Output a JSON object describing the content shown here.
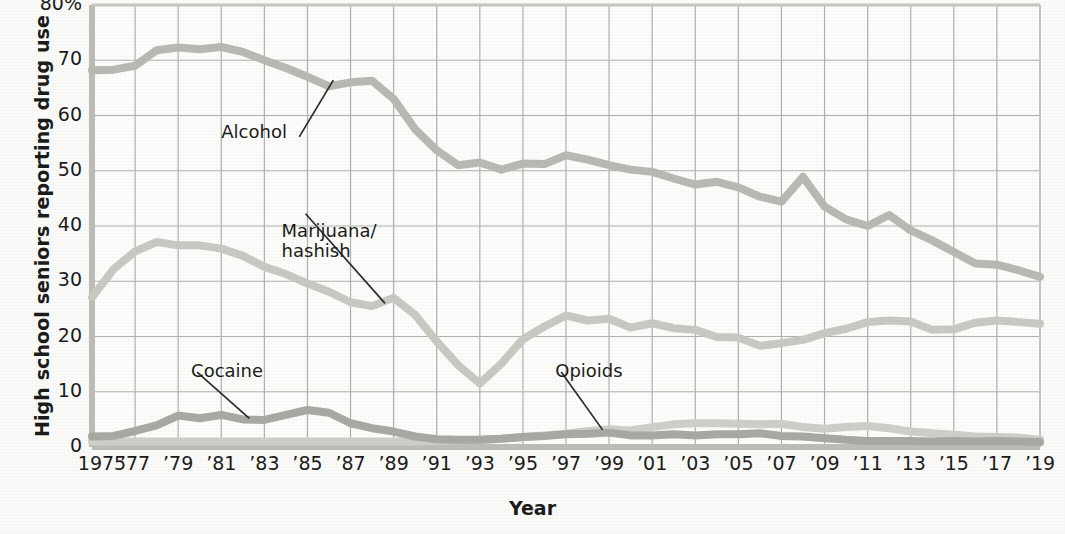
{
  "chart_data": {
    "type": "line",
    "title": "",
    "xlabel": "Year",
    "ylabel": "High school seniors reporting drug use",
    "xlim": [
      1975,
      2019
    ],
    "ylim": [
      0,
      80
    ],
    "grid": true,
    "legend_position": "inline-annotations",
    "y_ticks": [
      {
        "value": 0,
        "label": "0"
      },
      {
        "value": 10,
        "label": "10"
      },
      {
        "value": 20,
        "label": "20"
      },
      {
        "value": 30,
        "label": "30"
      },
      {
        "value": 40,
        "label": "40"
      },
      {
        "value": 50,
        "label": "50"
      },
      {
        "value": 60,
        "label": "60"
      },
      {
        "value": 70,
        "label": "70"
      },
      {
        "value": 80,
        "label": "80%"
      }
    ],
    "x_ticks": [
      {
        "value": 1975,
        "label": "1975"
      },
      {
        "value": 1977,
        "label": "’77"
      },
      {
        "value": 1979,
        "label": "’79"
      },
      {
        "value": 1981,
        "label": "’81"
      },
      {
        "value": 1983,
        "label": "’83"
      },
      {
        "value": 1985,
        "label": "’85"
      },
      {
        "value": 1987,
        "label": "’87"
      },
      {
        "value": 1989,
        "label": "’89"
      },
      {
        "value": 1991,
        "label": "’91"
      },
      {
        "value": 1993,
        "label": "’93"
      },
      {
        "value": 1995,
        "label": "’95"
      },
      {
        "value": 1997,
        "label": "’97"
      },
      {
        "value": 1999,
        "label": "’99"
      },
      {
        "value": 2001,
        "label": "’01"
      },
      {
        "value": 2003,
        "label": "’03"
      },
      {
        "value": 2005,
        "label": "’05"
      },
      {
        "value": 2007,
        "label": "’07"
      },
      {
        "value": 2009,
        "label": "’09"
      },
      {
        "value": 2011,
        "label": "’11"
      },
      {
        "value": 2013,
        "label": "’13"
      },
      {
        "value": 2015,
        "label": "’15"
      },
      {
        "value": 2017,
        "label": "’17"
      },
      {
        "value": 2019,
        "label": "’19"
      }
    ],
    "x": [
      1975,
      1976,
      1977,
      1978,
      1979,
      1980,
      1981,
      1982,
      1983,
      1984,
      1985,
      1986,
      1987,
      1988,
      1989,
      1990,
      1991,
      1992,
      1993,
      1994,
      1995,
      1996,
      1997,
      1998,
      1999,
      2000,
      2001,
      2002,
      2003,
      2004,
      2005,
      2006,
      2007,
      2008,
      2009,
      2010,
      2011,
      2012,
      2013,
      2014,
      2015,
      2016,
      2017,
      2018,
      2019
    ],
    "series": [
      {
        "name": "Alcohol",
        "color": "#b9b9b4",
        "values": [
          68.2,
          68.3,
          69.0,
          71.8,
          72.3,
          72.0,
          72.4,
          71.5,
          70.0,
          68.6,
          67.0,
          65.3,
          66.0,
          66.3,
          63.0,
          57.5,
          53.7,
          51.0,
          51.5,
          50.2,
          51.3,
          51.2,
          52.8,
          52.0,
          51.0,
          50.2,
          49.8,
          48.6,
          47.5,
          48.0,
          47.0,
          45.3,
          44.4,
          48.9,
          43.5,
          41.2,
          40.0,
          42.0,
          39.2,
          37.4,
          35.3,
          33.2,
          33.0,
          32.0,
          30.8
        ]
      },
      {
        "name": "Marijuana/\nhashish",
        "color": "#c9c9c4",
        "values": [
          27.1,
          32.2,
          35.4,
          37.1,
          36.5,
          36.5,
          35.9,
          34.6,
          32.6,
          31.3,
          29.6,
          28.1,
          26.2,
          25.5,
          27.0,
          23.9,
          19.1,
          14.8,
          11.5,
          15.1,
          19.5,
          21.8,
          23.8,
          22.9,
          23.2,
          21.6,
          22.4,
          21.5,
          21.2,
          19.9,
          19.8,
          18.3,
          18.8,
          19.4,
          20.6,
          21.4,
          22.6,
          22.9,
          22.7,
          21.2,
          21.3,
          22.5,
          22.9,
          22.6,
          22.3
        ]
      },
      {
        "name": "Cocaine",
        "color": "#a9a9a4",
        "values": [
          1.9,
          2.0,
          2.9,
          3.9,
          5.7,
          5.2,
          5.8,
          5.0,
          4.9,
          5.8,
          6.7,
          6.2,
          4.3,
          3.4,
          2.8,
          1.9,
          1.4,
          1.3,
          1.3,
          1.5,
          1.8,
          2.0,
          2.3,
          2.4,
          2.6,
          2.1,
          2.1,
          2.3,
          2.1,
          2.3,
          2.3,
          2.5,
          2.0,
          1.9,
          1.6,
          1.3,
          1.1,
          1.1,
          1.1,
          1.0,
          1.1,
          1.0,
          1.1,
          1.0,
          0.9
        ]
      },
      {
        "name": "Opioids",
        "color": "#cfcfca",
        "values": [
          1.0,
          1.0,
          1.0,
          1.0,
          1.0,
          1.0,
          1.0,
          1.0,
          1.0,
          1.0,
          1.0,
          1.0,
          1.0,
          1.0,
          1.0,
          1.0,
          1.1,
          1.2,
          1.3,
          1.5,
          1.8,
          2.1,
          2.4,
          2.9,
          3.2,
          3.0,
          3.6,
          4.1,
          4.3,
          4.3,
          4.2,
          4.1,
          4.2,
          3.6,
          3.3,
          3.6,
          3.8,
          3.4,
          2.8,
          2.5,
          2.2,
          1.9,
          1.8,
          1.7,
          1.3
        ]
      }
    ],
    "annotations": [
      {
        "name": "Alcohol",
        "text": "Alcohol",
        "label_x": 1981.0,
        "label_y": 56.5,
        "leader_to_x": 1986.2,
        "leader_to_y": 66.4
      },
      {
        "name": "Marijuana/hashish",
        "text": "Marijuana/\nhashish",
        "label_x": 1983.8,
        "label_y": 38.6,
        "leader_to_x": 1988.6,
        "leader_to_y": 26.0
      },
      {
        "name": "Cocaine",
        "text": "Cocaine",
        "label_x": 1979.6,
        "label_y": 13.2,
        "leader_to_x": 1982.3,
        "leader_to_y": 5.2
      },
      {
        "name": "Opioids",
        "text": "Opioids",
        "label_x": 1996.5,
        "label_y": 13.2,
        "leader_to_x": 1998.7,
        "leader_to_y": 3.1
      }
    ]
  },
  "axis": {
    "y_title": "High school seniors reporting drug use",
    "x_title": "Year"
  }
}
